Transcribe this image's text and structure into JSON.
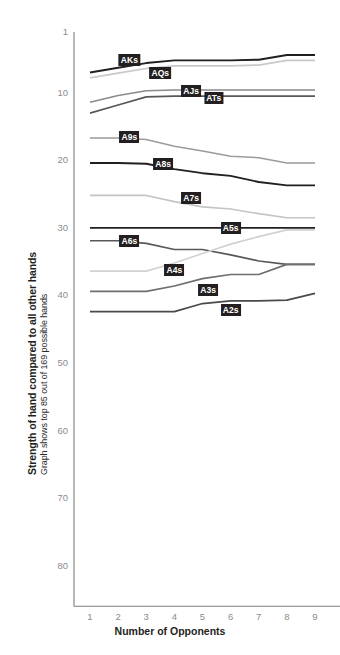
{
  "chart_data": {
    "type": "line",
    "title": "",
    "ylabel": "Strength of hand compared to all other hands",
    "ylabel_sub": "Graph shows top 85 out of 169 possible hands",
    "xlabel": "Number of Opponents",
    "x": [
      1,
      2,
      3,
      4,
      5,
      6,
      7,
      8,
      9
    ],
    "xticklabels": [
      "1",
      "2",
      "3",
      "4",
      "5",
      "6",
      "7",
      "8",
      "9"
    ],
    "yticks": [
      1,
      10,
      20,
      30,
      40,
      50,
      60,
      70,
      80
    ],
    "yticklabels": [
      "1",
      "10",
      "20",
      "30",
      "40",
      "50",
      "60",
      "70",
      "80"
    ],
    "ylim": [
      1,
      86
    ],
    "xlim": [
      1,
      9
    ],
    "y_inverted": true,
    "grid": false,
    "legend": "inline-labels",
    "series": [
      {
        "name": "AKs",
        "color": "#231f20",
        "width": 1.9,
        "values": [
          7.0,
          6.3,
          5.6,
          5.2,
          5.2,
          5.2,
          5.1,
          4.4,
          4.4
        ],
        "label_x": 2.4,
        "label_y": 5.1
      },
      {
        "name": "AQs",
        "color": "#c9c9c9",
        "width": 1.7,
        "values": [
          7.8,
          7.1,
          6.4,
          6.0,
          6.0,
          6.0,
          5.9,
          5.2,
          5.2
        ],
        "label_x": 3.5,
        "label_y": 7.0
      },
      {
        "name": "AJs",
        "color": "#8a8a8a",
        "width": 1.5,
        "values": [
          11.4,
          10.4,
          9.7,
          9.6,
          9.6,
          9.6,
          9.6,
          9.6,
          9.6
        ],
        "label_x": 4.6,
        "label_y": 9.8
      },
      {
        "name": "ATs",
        "color": "#58585a",
        "width": 1.7,
        "values": [
          13.0,
          11.8,
          10.6,
          10.5,
          10.5,
          10.5,
          10.5,
          10.5,
          10.5
        ],
        "label_x": 5.4,
        "label_y": 10.8
      },
      {
        "name": "A9s",
        "color": "#9b9b9b",
        "width": 1.5,
        "values": [
          16.7,
          16.7,
          16.9,
          17.9,
          18.6,
          19.4,
          19.6,
          20.4,
          20.4
        ],
        "label_x": 2.4,
        "label_y": 16.6
      },
      {
        "name": "A8s",
        "color": "#231f20",
        "width": 1.9,
        "values": [
          20.4,
          20.4,
          20.5,
          21.3,
          21.9,
          22.3,
          23.2,
          23.7,
          23.7
        ],
        "label_x": 3.6,
        "label_y": 20.6
      },
      {
        "name": "A7s",
        "color": "#c4c4c4",
        "width": 1.7,
        "values": [
          25.2,
          25.2,
          25.2,
          26.1,
          26.9,
          27.2,
          27.9,
          28.5,
          28.5
        ],
        "label_x": 4.6,
        "label_y": 25.6
      },
      {
        "name": "A5s",
        "color": "#231f20",
        "width": 1.9,
        "values": [
          30.0,
          30.0,
          30.0,
          30.0,
          30.0,
          30.0,
          30.0,
          30.0,
          30.0
        ],
        "label_x": 6.0,
        "label_y": 30.0
      },
      {
        "name": "A6s",
        "color": "#58585a",
        "width": 1.7,
        "values": [
          31.9,
          31.9,
          32.3,
          33.2,
          33.2,
          34.0,
          34.9,
          35.4,
          35.4
        ],
        "label_x": 2.4,
        "label_y": 32.0
      },
      {
        "name": "A4s",
        "color": "#d2d2d2",
        "width": 1.7,
        "values": [
          36.4,
          36.4,
          36.4,
          35.2,
          33.8,
          32.4,
          31.3,
          30.3,
          30.3
        ],
        "label_x": 4.0,
        "label_y": 36.3
      },
      {
        "name": "A3s",
        "color": "#6e6e70",
        "width": 1.7,
        "values": [
          39.4,
          39.4,
          39.4,
          38.6,
          37.5,
          36.9,
          36.9,
          35.4,
          35.4
        ],
        "label_x": 5.2,
        "label_y": 39.2
      },
      {
        "name": "A2s",
        "color": "#4a4a4c",
        "width": 1.7,
        "values": [
          42.4,
          42.4,
          42.4,
          42.4,
          41.2,
          40.8,
          40.8,
          40.7,
          39.7
        ],
        "label_x": 6.0,
        "label_y": 42.1
      }
    ]
  }
}
